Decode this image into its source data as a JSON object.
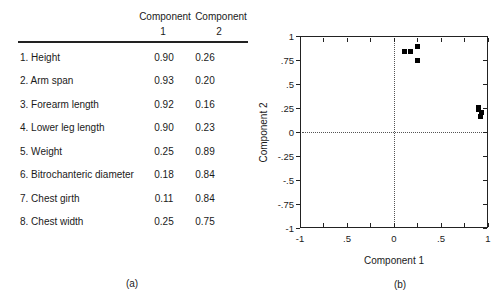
{
  "table": {
    "header": {
      "component_1_title": "Component",
      "component_1_number": "1",
      "component_2_title": "Component",
      "component_2_number": "2"
    },
    "rows": [
      {
        "label": "1. Height",
        "component_1": "0.90",
        "component_2": "0.26"
      },
      {
        "label": "2. Arm span",
        "component_1": "0.93",
        "component_2": "0.20"
      },
      {
        "label": "3. Forearm length",
        "component_1": "0.92",
        "component_2": "0.16"
      },
      {
        "label": "4. Lower leg length",
        "component_1": "0.90",
        "component_2": "0.23"
      },
      {
        "label": "5. Weight",
        "component_1": "0.25",
        "component_2": "0.89"
      },
      {
        "label": "6. Bitrochanteric diameter",
        "component_1": "0.18",
        "component_2": "0.84"
      },
      {
        "label": "7. Chest girth",
        "component_1": "0.11",
        "component_2": "0.84"
      },
      {
        "label": "8. Chest width",
        "component_1": "0.25",
        "component_2": "0.75"
      }
    ],
    "caption": "(a)"
  },
  "plot": {
    "xlabel": "Component 1",
    "ylabel": "Component 2",
    "caption": "(b)"
  },
  "chart_data": {
    "type": "scatter",
    "title": "",
    "xlabel": "Component 1",
    "ylabel": "Component 2",
    "xlim": [
      -1,
      1
    ],
    "ylim": [
      -1,
      1
    ],
    "grid": false,
    "marker": "filled-black-square",
    "reference_lines": [
      {
        "axis": "x",
        "value": 0,
        "style": "dotted"
      },
      {
        "axis": "y",
        "value": 0,
        "style": "dotted"
      }
    ],
    "x_ticks": [
      -1,
      -0.75,
      -0.5,
      -0.25,
      0,
      0.25,
      0.5,
      0.75,
      1
    ],
    "y_ticks": [
      -1,
      -0.75,
      -0.5,
      -0.25,
      0,
      0.25,
      0.5,
      0.75,
      1
    ],
    "x_tick_labels": [
      {
        "value": -1,
        "label": "-1"
      },
      {
        "value": -0.5,
        "label": ".5"
      },
      {
        "value": 0,
        "label": "0"
      },
      {
        "value": 0.5,
        "label": ".5"
      },
      {
        "value": 1,
        "label": "1"
      }
    ],
    "y_tick_labels": [
      {
        "value": 1,
        "label": "1"
      },
      {
        "value": 0.75,
        "label": ".75"
      },
      {
        "value": 0.5,
        "label": ".5"
      },
      {
        "value": 0.25,
        "label": ".25"
      },
      {
        "value": 0,
        "label": "0"
      },
      {
        "value": -0.25,
        "label": "-.25"
      },
      {
        "value": -0.5,
        "label": "-.5"
      },
      {
        "value": -0.75,
        "label": "-.75"
      },
      {
        "value": -1,
        "label": "-1"
      }
    ],
    "points": [
      {
        "label": "1. Height",
        "x": 0.9,
        "y": 0.26
      },
      {
        "label": "2. Arm span",
        "x": 0.93,
        "y": 0.2
      },
      {
        "label": "3. Forearm length",
        "x": 0.92,
        "y": 0.16
      },
      {
        "label": "4. Lower leg length",
        "x": 0.9,
        "y": 0.23
      },
      {
        "label": "5. Weight",
        "x": 0.25,
        "y": 0.89
      },
      {
        "label": "6. Bitrochanteric diameter",
        "x": 0.18,
        "y": 0.84
      },
      {
        "label": "7. Chest girth",
        "x": 0.11,
        "y": 0.84
      },
      {
        "label": "8. Chest width",
        "x": 0.25,
        "y": 0.75
      }
    ]
  }
}
